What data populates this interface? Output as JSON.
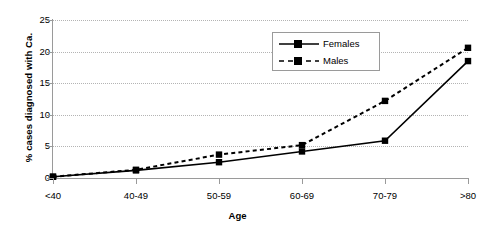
{
  "chart_data": {
    "type": "line",
    "title": "",
    "xlabel": "Age",
    "ylabel": "% cases diagnosed with Ca.",
    "categories": [
      "<40",
      "40-49",
      "50-59",
      "60-69",
      "70-79",
      ">80"
    ],
    "series": [
      {
        "name": "Females",
        "values": [
          0.2,
          1.2,
          2.5,
          4.2,
          5.9,
          18.5
        ],
        "line_style": "solid",
        "marker": "filled-square",
        "color": "#000000"
      },
      {
        "name": "Males",
        "values": [
          0.2,
          1.3,
          3.7,
          5.2,
          12.2,
          20.6
        ],
        "line_style": "dashed",
        "marker": "filled-square",
        "color": "#000000"
      }
    ],
    "ylim": [
      0,
      25
    ],
    "y_ticks": [
      0,
      5,
      10,
      15,
      20,
      25
    ],
    "y_tick_labels": [
      "0",
      "5",
      "10",
      "15",
      "20",
      "25"
    ],
    "grid": "horizontal-dotted",
    "legend_position": "top-right-inside"
  },
  "axes": {
    "y_title": "% cases diagnosed with Ca.",
    "x_title": "Age"
  },
  "legend": {
    "entries": [
      {
        "label": "Females"
      },
      {
        "label": "Males"
      }
    ]
  }
}
